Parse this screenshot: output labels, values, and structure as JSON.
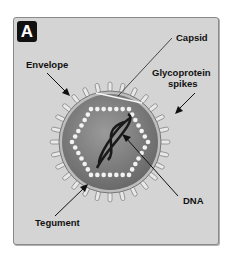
{
  "panel": {
    "badge": "A",
    "background": "#d4d4d4"
  },
  "labels": {
    "capsid": "Capsid",
    "envelope": "Envelope",
    "glyco_line1": "Glycoprotein",
    "glyco_line2": "spikes",
    "dna": "DNA",
    "tegument": "Tegument"
  },
  "colors": {
    "envelope_fill": "#7f7f7f",
    "capsid_beads": "#f2f2f2",
    "dna": "#1a1a1a",
    "spikes": "#e6e6e6"
  }
}
